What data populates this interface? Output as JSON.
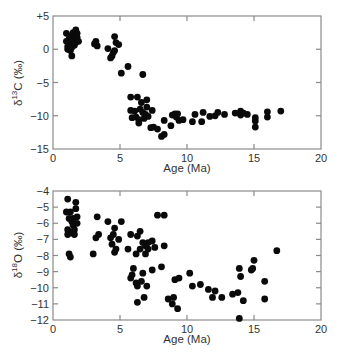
{
  "chart_data": [
    {
      "type": "scatter",
      "title": "",
      "xlabel": "Age (Ma)",
      "ylabel": "δ13C (‰)",
      "ylabel_main": "δ",
      "ylabel_sup": "13",
      "ylabel_rest": "C (‰)",
      "xlim": [
        0,
        20
      ],
      "ylim": [
        -15,
        5
      ],
      "xticks": [
        0,
        5,
        10,
        15,
        20
      ],
      "xtick_labels": [
        "0",
        "5",
        "10",
        "15",
        "20"
      ],
      "yticks": [
        5,
        0,
        -5,
        -10,
        -15
      ],
      "ytick_labels": [
        "+5",
        "0",
        "−5",
        "−10",
        "−15"
      ],
      "grid": false,
      "legend": null,
      "marker_color": "#0a0a0a",
      "points": [
        [
          1.0,
          2.4
        ],
        [
          1.0,
          1.2
        ],
        [
          1.1,
          0.4
        ],
        [
          1.1,
          0.0
        ],
        [
          1.2,
          1.6
        ],
        [
          1.2,
          0.8
        ],
        [
          1.3,
          2.0
        ],
        [
          1.3,
          -0.2
        ],
        [
          1.4,
          1.0
        ],
        [
          1.4,
          0.3
        ],
        [
          1.4,
          -1.0
        ],
        [
          1.5,
          2.5
        ],
        [
          1.5,
          1.4
        ],
        [
          1.6,
          0.6
        ],
        [
          1.6,
          2.0
        ],
        [
          1.7,
          2.9
        ],
        [
          1.7,
          1.0
        ],
        [
          1.8,
          1.8
        ],
        [
          1.8,
          2.4
        ],
        [
          1.9,
          1.2
        ],
        [
          3.1,
          0.8
        ],
        [
          3.2,
          1.2
        ],
        [
          3.3,
          0.5
        ],
        [
          4.1,
          0.1
        ],
        [
          4.3,
          -1.3
        ],
        [
          4.4,
          -1.0
        ],
        [
          4.5,
          -0.5
        ],
        [
          4.6,
          1.9
        ],
        [
          4.6,
          -0.2
        ],
        [
          4.7,
          1.0
        ],
        [
          4.9,
          0.7
        ],
        [
          5.1,
          -3.6
        ],
        [
          5.6,
          -2.6
        ],
        [
          6.7,
          -3.8
        ],
        [
          5.8,
          -7.2
        ],
        [
          5.8,
          -9.2
        ],
        [
          5.9,
          -10.3
        ],
        [
          6.1,
          -9.3
        ],
        [
          6.2,
          -10.2
        ],
        [
          6.3,
          -7.2
        ],
        [
          6.4,
          -10.6
        ],
        [
          6.4,
          -11.1
        ],
        [
          6.5,
          -9.0
        ],
        [
          6.6,
          -8.0
        ],
        [
          6.7,
          -9.5
        ],
        [
          6.8,
          -10.4
        ],
        [
          6.9,
          -9.8
        ],
        [
          7.0,
          -7.6
        ],
        [
          7.0,
          -8.7
        ],
        [
          7.1,
          -10.1
        ],
        [
          7.3,
          -11.8
        ],
        [
          7.4,
          -9.2
        ],
        [
          7.5,
          -11.7
        ],
        [
          7.8,
          -12.0
        ],
        [
          8.1,
          -13.1
        ],
        [
          8.3,
          -12.8
        ],
        [
          8.3,
          -10.7
        ],
        [
          8.8,
          -11.5
        ],
        [
          8.9,
          -9.9
        ],
        [
          9.1,
          -9.7
        ],
        [
          9.2,
          -10.2
        ],
        [
          9.3,
          -9.7
        ],
        [
          9.4,
          -10.7
        ],
        [
          9.7,
          -10.6
        ],
        [
          10.4,
          -10.9
        ],
        [
          10.6,
          -9.8
        ],
        [
          11.1,
          -10.9
        ],
        [
          11.2,
          -9.5
        ],
        [
          11.7,
          -10.1
        ],
        [
          12.1,
          -10.0
        ],
        [
          12.3,
          -9.5
        ],
        [
          12.8,
          -9.8
        ],
        [
          13.6,
          -9.6
        ],
        [
          14.0,
          -9.3
        ],
        [
          14.0,
          -9.9
        ],
        [
          14.2,
          -9.6
        ],
        [
          14.5,
          -9.8
        ],
        [
          15.1,
          -10.3
        ],
        [
          15.1,
          -10.8
        ],
        [
          15.1,
          -11.7
        ],
        [
          16.0,
          -9.4
        ],
        [
          16.0,
          -10.2
        ],
        [
          17.0,
          -9.3
        ]
      ]
    },
    {
      "type": "scatter",
      "title": "",
      "xlabel": "Age (Ma)",
      "ylabel": "δ18O (‰)",
      "ylabel_main": "δ",
      "ylabel_sup": "18",
      "ylabel_rest": "O (‰)",
      "xlim": [
        0,
        20
      ],
      "ylim": [
        -12,
        -4
      ],
      "xticks": [
        0,
        5,
        10,
        15,
        20
      ],
      "xtick_labels": [
        "0",
        "5",
        "10",
        "15",
        "20"
      ],
      "yticks": [
        -4,
        -5,
        -6,
        -7,
        -8,
        -9,
        -10,
        -11,
        -12
      ],
      "ytick_labels": [
        "−4",
        "−5",
        "−6",
        "−7",
        "−8",
        "−9",
        "−10",
        "−11",
        "−12"
      ],
      "grid": false,
      "legend": null,
      "marker_color": "#0a0a0a",
      "points": [
        [
          1.1,
          -4.5
        ],
        [
          1.0,
          -5.3
        ],
        [
          1.2,
          -5.7
        ],
        [
          1.1,
          -6.4
        ],
        [
          1.1,
          -6.7
        ],
        [
          1.3,
          -5.3
        ],
        [
          1.4,
          -5.9
        ],
        [
          1.4,
          -6.6
        ],
        [
          1.5,
          -5.7
        ],
        [
          1.5,
          -6.1
        ],
        [
          1.6,
          -6.4
        ],
        [
          1.6,
          -6.7
        ],
        [
          1.7,
          -5.1
        ],
        [
          1.7,
          -4.7
        ],
        [
          1.8,
          -5.6
        ],
        [
          1.8,
          -6.0
        ],
        [
          1.2,
          -7.9
        ],
        [
          1.3,
          -8.1
        ],
        [
          3.0,
          -7.9
        ],
        [
          3.2,
          -6.9
        ],
        [
          3.3,
          -5.6
        ],
        [
          3.4,
          -6.7
        ],
        [
          4.1,
          -5.9
        ],
        [
          4.3,
          -6.9
        ],
        [
          4.4,
          -7.3
        ],
        [
          4.5,
          -6.7
        ],
        [
          4.6,
          -6.3
        ],
        [
          4.6,
          -7.8
        ],
        [
          4.7,
          -7.6
        ],
        [
          4.9,
          -7.0
        ],
        [
          5.1,
          -5.9
        ],
        [
          5.6,
          -7.6
        ],
        [
          5.8,
          -6.7
        ],
        [
          5.8,
          -9.4
        ],
        [
          5.9,
          -9.2
        ],
        [
          6.0,
          -8.8
        ],
        [
          6.2,
          -7.9
        ],
        [
          6.2,
          -9.7
        ],
        [
          6.3,
          -6.8
        ],
        [
          6.3,
          -9.9
        ],
        [
          6.3,
          -10.9
        ],
        [
          6.5,
          -6.5
        ],
        [
          6.5,
          -7.6
        ],
        [
          6.6,
          -9.6
        ],
        [
          6.7,
          -7.2
        ],
        [
          6.7,
          -9.1
        ],
        [
          6.8,
          -10.6
        ],
        [
          6.9,
          -7.4
        ],
        [
          6.9,
          -7.9
        ],
        [
          7.0,
          -9.9
        ],
        [
          7.1,
          -7.2
        ],
        [
          7.1,
          -7.6
        ],
        [
          7.4,
          -8.9
        ],
        [
          7.4,
          -7.1
        ],
        [
          7.6,
          -7.5
        ],
        [
          7.8,
          -5.5
        ],
        [
          8.1,
          -8.7
        ],
        [
          8.3,
          -7.4
        ],
        [
          8.3,
          -5.5
        ],
        [
          8.6,
          -10.7
        ],
        [
          8.9,
          -11.0
        ],
        [
          9.0,
          -10.6
        ],
        [
          9.1,
          -9.5
        ],
        [
          9.3,
          -11.3
        ],
        [
          9.4,
          -9.4
        ],
        [
          10.2,
          -9.1
        ],
        [
          10.4,
          -9.9
        ],
        [
          11.0,
          -9.8
        ],
        [
          11.6,
          -10.1
        ],
        [
          11.9,
          -10.6
        ],
        [
          12.1,
          -10.2
        ],
        [
          12.6,
          -10.6
        ],
        [
          13.4,
          -10.4
        ],
        [
          13.8,
          -10.3
        ],
        [
          13.9,
          -8.8
        ],
        [
          13.9,
          -11.9
        ],
        [
          14.0,
          -9.3
        ],
        [
          14.2,
          -10.8
        ],
        [
          14.8,
          -8.9
        ],
        [
          14.9,
          -8.8
        ],
        [
          15.0,
          -8.3
        ],
        [
          15.8,
          -9.6
        ],
        [
          15.8,
          -10.7
        ],
        [
          16.7,
          -7.7
        ]
      ]
    }
  ]
}
